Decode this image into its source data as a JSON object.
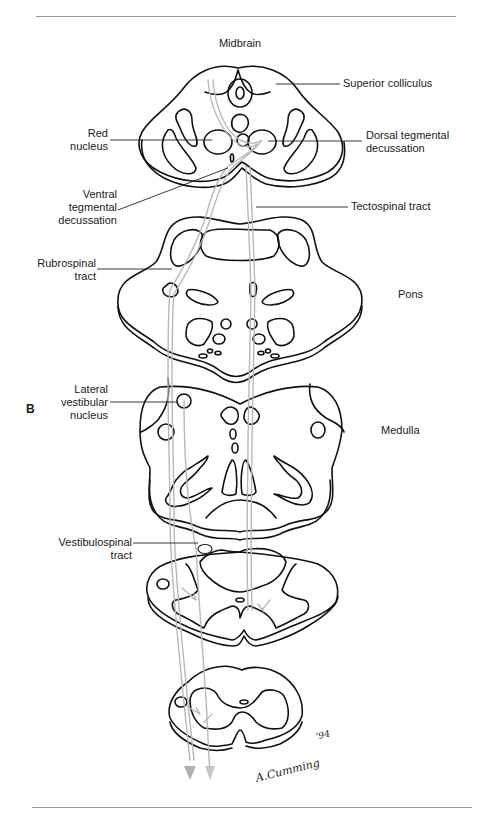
{
  "figure": {
    "panel_letter": "B",
    "section_titles": {
      "midbrain": "Midbrain",
      "pons": "Pons",
      "medulla": "Medulla"
    },
    "labels": {
      "superior_colliculus": "Superior colliculus",
      "red_nucleus": [
        "Red",
        "nucleus"
      ],
      "dorsal_tegmental_decussation": [
        "Dorsal tegmental",
        "decussation"
      ],
      "ventral_tegmental_decussation": [
        "Ventral",
        "tegmental",
        "decussation"
      ],
      "tectospinal_tract": "Tectospinal tract",
      "rubrospinal_tract": [
        "Rubrospinal",
        "tract"
      ],
      "lateral_vestibular_nucleus": [
        "Lateral",
        "vestibular",
        "nucleus"
      ],
      "vestibulospinal_tract": [
        "Vestibulospinal",
        "tract"
      ]
    },
    "signature": "A.Cumming",
    "signature_year": "'94",
    "colors": {
      "outline": "#111111",
      "tract": "#b8b8b8",
      "rule": "#9a9a9a"
    }
  }
}
